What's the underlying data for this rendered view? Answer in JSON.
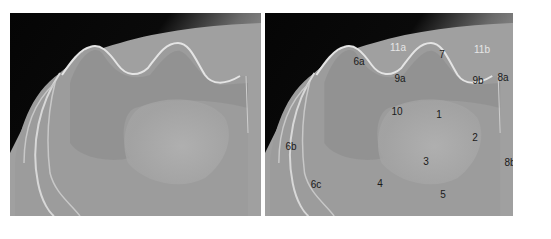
{
  "figure": {
    "panels": [
      {
        "id": "left",
        "description": "unlabeled radiograph"
      },
      {
        "id": "right",
        "description": "labeled radiograph"
      }
    ],
    "labels": [
      {
        "text": "11a",
        "x": 133,
        "y": 35,
        "light": true
      },
      {
        "text": "7",
        "x": 177,
        "y": 42,
        "light": false
      },
      {
        "text": "11b",
        "x": 217,
        "y": 37,
        "light": true
      },
      {
        "text": "6a",
        "x": 94,
        "y": 49,
        "light": false
      },
      {
        "text": "9a",
        "x": 135,
        "y": 66,
        "light": false
      },
      {
        "text": "9b",
        "x": 213,
        "y": 68,
        "light": false
      },
      {
        "text": "8a",
        "x": 238,
        "y": 65,
        "light": false
      },
      {
        "text": "10",
        "x": 132,
        "y": 99,
        "light": false
      },
      {
        "text": "1",
        "x": 174,
        "y": 102,
        "light": false
      },
      {
        "text": "2",
        "x": 210,
        "y": 125,
        "light": false
      },
      {
        "text": "6b",
        "x": 26,
        "y": 134,
        "light": false
      },
      {
        "text": "3",
        "x": 161,
        "y": 149,
        "light": false
      },
      {
        "text": "8b",
        "x": 245,
        "y": 150,
        "light": false
      },
      {
        "text": "6c",
        "x": 51,
        "y": 172,
        "light": false
      },
      {
        "text": "4",
        "x": 115,
        "y": 171,
        "light": false
      },
      {
        "text": "5",
        "x": 178,
        "y": 182,
        "light": false
      }
    ],
    "caption": " "
  },
  "colors": {
    "background": "#ffffff",
    "bone": "#a8a8a8",
    "soft_tissue": "#8c8c8c",
    "air": "#050505",
    "cortex_edge": "#e0e0e0"
  }
}
